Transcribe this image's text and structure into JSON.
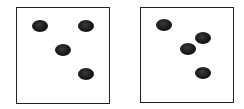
{
  "figure": {
    "panels": [
      {
        "name": "left-panel",
        "box": {
          "x": 16,
          "y": 7,
          "w": 94,
          "h": 97
        },
        "dots": [
          {
            "cx": 40,
            "cy": 26
          },
          {
            "cx": 86,
            "cy": 26
          },
          {
            "cx": 63,
            "cy": 50
          },
          {
            "cx": 86,
            "cy": 74
          }
        ]
      },
      {
        "name": "right-panel",
        "box": {
          "x": 140,
          "y": 7,
          "w": 94,
          "h": 96
        },
        "dots": [
          {
            "cx": 164,
            "cy": 25
          },
          {
            "cx": 203,
            "cy": 38
          },
          {
            "cx": 188,
            "cy": 49
          },
          {
            "cx": 203,
            "cy": 73
          }
        ]
      }
    ],
    "dot_size": {
      "w": 16,
      "h": 12
    },
    "colors": {
      "border": "#222222",
      "dot": "#151515",
      "background": "#ffffff"
    }
  }
}
